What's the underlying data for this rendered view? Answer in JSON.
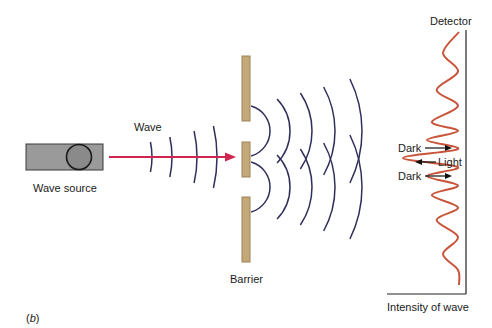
{
  "figure": {
    "panel_label": "(b)",
    "panel_letter": "b"
  },
  "labels": {
    "wave_source": "Wave source",
    "wave": "Wave",
    "barrier": "Barrier",
    "detector": "Detector",
    "dark_top": "Dark",
    "light": "Light",
    "dark_bottom": "Dark",
    "intensity_axis": "Intensity of wave"
  },
  "colors": {
    "wavefront": "#2f2f5a",
    "beam_arrow": "#d0254f",
    "barrier_fill": "#c4a878",
    "barrier_stroke": "#9a8258",
    "source_box": "#9a9a9a",
    "intensity_curve": "#c8553a",
    "axis": "#222222"
  },
  "diagram": {
    "incident_wavefront_count": 4,
    "slit_count": 2,
    "diffracted_wavefronts_per_slit": 5,
    "intensity_pattern": {
      "description": "interference pattern with central bright fringe",
      "maxima_relative": [
        0.2,
        0.28,
        0.34,
        0.4,
        0.7,
        0.4,
        0.34,
        0.28,
        0.2
      ]
    }
  }
}
